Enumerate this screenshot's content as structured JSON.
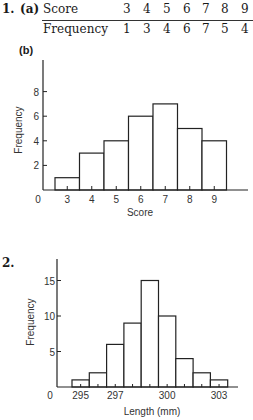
{
  "q1": {
    "number": "1.",
    "part_a": "(a)",
    "part_b": "(b)",
    "table": {
      "row_labels": [
        "Score",
        "Frequency"
      ],
      "scores": [
        "3",
        "4",
        "5",
        "6",
        "7",
        "8",
        "9"
      ],
      "frequencies": [
        "1",
        "3",
        "4",
        "6",
        "7",
        "5",
        "4"
      ]
    }
  },
  "q2": {
    "number": "2."
  },
  "chart_data": [
    {
      "type": "bar",
      "title": "",
      "xlabel": "Score",
      "ylabel": "Frequency",
      "categories": [
        "3",
        "4",
        "5",
        "6",
        "7",
        "8",
        "9"
      ],
      "values": [
        1,
        3,
        4,
        6,
        7,
        5,
        4
      ],
      "yticks": [
        "2",
        "4",
        "6",
        "8"
      ],
      "origin_label": "0",
      "ylim": [
        0,
        10
      ],
      "grid": false,
      "histogram": true
    },
    {
      "type": "bar",
      "title": "",
      "xlabel": "Length (mm)",
      "ylabel": "Frequency",
      "bin_centers": [
        295,
        296,
        297,
        298,
        299,
        300,
        301,
        302,
        303
      ],
      "values": [
        1,
        2,
        6,
        9,
        15,
        10,
        4,
        2,
        1
      ],
      "xtick_labels": [
        "295",
        "297",
        "300",
        "303"
      ],
      "yticks": [
        "5",
        "10",
        "15"
      ],
      "origin_label": "0",
      "ylim": [
        0,
        18
      ],
      "grid": false,
      "histogram": true
    }
  ]
}
